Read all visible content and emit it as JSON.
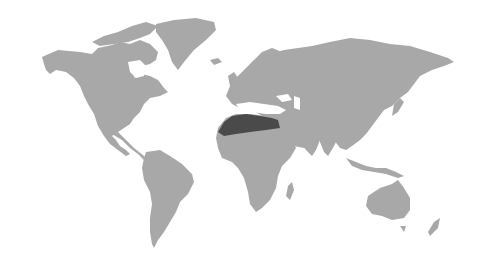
{
  "map": {
    "title": "World map with highlighted region",
    "projection": "equirectangular-like",
    "background_color": "#ffffff",
    "land_color": "#a8a8a8",
    "highlight_color": "#4a4a4a",
    "highlighted_region": "North Africa (Sahara band)",
    "continents": [
      "North America",
      "Greenland",
      "South America",
      "Europe",
      "Africa",
      "Asia",
      "Australia",
      "New Zealand"
    ]
  }
}
